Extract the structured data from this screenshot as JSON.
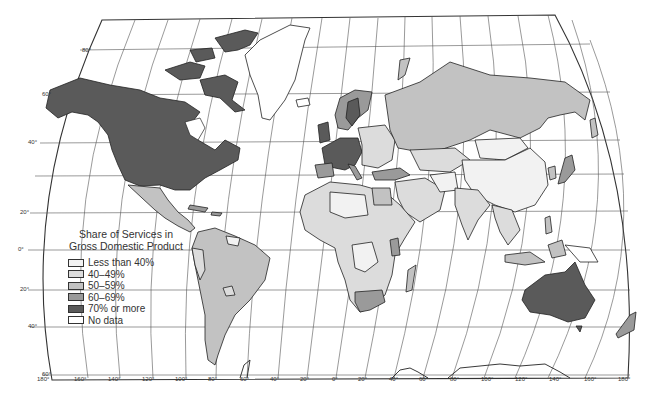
{
  "map": {
    "title": "Share of Services in Gross Domestic Product",
    "legend": {
      "title_line1": "Share of Services in",
      "title_line2": "Gross Domestic Product",
      "items": [
        {
          "label": "Less than 40%",
          "color": "#f2f2f2"
        },
        {
          "label": "40–49%",
          "color": "#dcdcdc"
        },
        {
          "label": "50–59%",
          "color": "#c2c2c2"
        },
        {
          "label": "60–69%",
          "color": "#9a9a9a"
        },
        {
          "label": "70% or more",
          "color": "#5a5a5a"
        },
        {
          "label": "No data",
          "color": "#ffffff"
        }
      ]
    },
    "latitude_labels": [
      "80°",
      "60°",
      "40°",
      "20°",
      "0°",
      "20°",
      "40°",
      "60°"
    ],
    "longitude_labels": [
      "180°",
      "160°",
      "140°",
      "120°",
      "100°",
      "80°",
      "60°",
      "40°",
      "20°",
      "0°",
      "20°",
      "40°",
      "60°",
      "80°",
      "100°",
      "120°",
      "140°",
      "160°",
      "180°"
    ],
    "regions": [
      {
        "name": "North America (USA/Canada)",
        "category": "70% or more"
      },
      {
        "name": "Greenland",
        "category": "No data"
      },
      {
        "name": "Mexico",
        "category": "50–59%"
      },
      {
        "name": "Central America",
        "category": "50–59%"
      },
      {
        "name": "South America (Brazil/Argentina)",
        "category": "50–59%"
      },
      {
        "name": "Western Europe",
        "category": "70% or more"
      },
      {
        "name": "Scandinavia",
        "category": "60–69%"
      },
      {
        "name": "Eastern Europe",
        "category": "40–49%"
      },
      {
        "name": "Russia",
        "category": "50–59%"
      },
      {
        "name": "China",
        "category": "Less than 40%"
      },
      {
        "name": "Mongolia",
        "category": "Less than 40%"
      },
      {
        "name": "Japan",
        "category": "60–69%"
      },
      {
        "name": "India",
        "category": "40–49%"
      },
      {
        "name": "Middle East",
        "category": "40–49%"
      },
      {
        "name": "Africa (mostly)",
        "category": "40–49%"
      },
      {
        "name": "South Africa",
        "category": "60–69%"
      },
      {
        "name": "Australia",
        "category": "70% or more"
      },
      {
        "name": "New Zealand",
        "category": "60–69%"
      },
      {
        "name": "Southeast Asia",
        "category": "40–49%"
      }
    ]
  }
}
